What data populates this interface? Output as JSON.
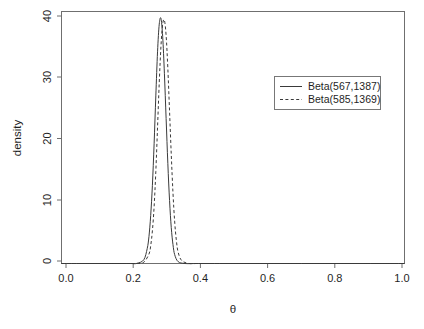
{
  "chart_data": {
    "type": "line",
    "title": "",
    "subtitle": "",
    "xlabel": "θ",
    "ylabel": "density",
    "xlim": [
      0.0,
      1.0
    ],
    "ylim": [
      0,
      40
    ],
    "grid": false,
    "legend_position": "right-upper",
    "xticks": [
      "0.0",
      "0.2",
      "0.4",
      "0.6",
      "0.8",
      "1.0"
    ],
    "xtick_values": [
      0.0,
      0.2,
      0.4,
      0.6,
      0.8,
      1.0
    ],
    "yticks": [
      "0",
      "10",
      "20",
      "30",
      "40"
    ],
    "ytick_values": [
      0,
      10,
      20,
      30,
      40
    ],
    "series": [
      {
        "name": "Beta(567,1387)",
        "linestyle": "solid",
        "color": "#3a3a3a",
        "alpha": 567,
        "beta": 1387,
        "peak_x": 0.29,
        "peak_y": 38.9,
        "x": [
          0.0,
          0.05,
          0.1,
          0.15,
          0.2,
          0.22,
          0.24,
          0.25,
          0.255,
          0.26,
          0.265,
          0.27,
          0.275,
          0.28,
          0.285,
          0.29,
          0.295,
          0.3,
          0.305,
          0.31,
          0.315,
          0.32,
          0.325,
          0.33,
          0.34,
          0.36,
          0.4,
          0.5,
          0.6,
          0.7,
          0.8,
          0.9,
          1.0
        ],
        "y": [
          0.0,
          0.0,
          0.0,
          0.0,
          0.0,
          0.02,
          0.6,
          2.4,
          4.3,
          7.6,
          12.4,
          19.0,
          26.6,
          33.6,
          38.0,
          38.9,
          36.0,
          30.2,
          23.0,
          15.9,
          10.0,
          5.7,
          3.0,
          1.4,
          0.3,
          0.0,
          0.0,
          0.0,
          0.0,
          0.0,
          0.0,
          0.0,
          0.0
        ]
      },
      {
        "name": "Beta(585,1369)",
        "linestyle": "dashed",
        "color": "#3a3a3a",
        "alpha": 585,
        "beta": 1369,
        "peak_x": 0.3,
        "peak_y": 38.6,
        "x": [
          0.0,
          0.05,
          0.1,
          0.15,
          0.2,
          0.22,
          0.24,
          0.255,
          0.26,
          0.265,
          0.27,
          0.275,
          0.28,
          0.285,
          0.29,
          0.295,
          0.3,
          0.305,
          0.31,
          0.315,
          0.32,
          0.325,
          0.33,
          0.335,
          0.34,
          0.35,
          0.37,
          0.4,
          0.5,
          0.6,
          0.7,
          0.8,
          0.9,
          1.0
        ],
        "y": [
          0.0,
          0.0,
          0.0,
          0.0,
          0.0,
          0.01,
          0.2,
          1.5,
          2.8,
          5.2,
          9.0,
          14.6,
          21.6,
          28.7,
          34.5,
          38.0,
          38.6,
          36.2,
          31.0,
          24.2,
          17.3,
          11.2,
          6.6,
          3.6,
          1.8,
          0.5,
          0.02,
          0.0,
          0.0,
          0.0,
          0.0,
          0.0,
          0.0,
          0.0
        ]
      }
    ],
    "legend": [
      {
        "label": "Beta(567,1387)",
        "linestyle": "solid"
      },
      {
        "label": "Beta(585,1369)",
        "linestyle": "dashed"
      }
    ]
  },
  "colors": {
    "background": "#ffffff",
    "frame": "#6f6f6f",
    "curve": "#3a3a3a",
    "text": "#1f1f1f"
  }
}
